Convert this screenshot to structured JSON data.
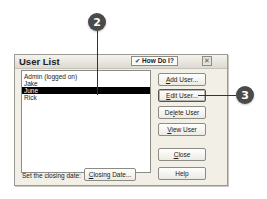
{
  "callouts": [
    {
      "label": "2",
      "target": "June list item"
    },
    {
      "label": "3",
      "target": "Edit User button"
    }
  ],
  "dialog": {
    "title": "User List",
    "how_do_i": {
      "label": "How Do I?",
      "icon": "chevron-down-icon"
    },
    "close_icon": "close-icon",
    "close_glyph": "✕",
    "users": [
      {
        "name": "Admin (logged on)",
        "selected": false
      },
      {
        "name": "Jake",
        "selected": false
      },
      {
        "name": "June",
        "selected": true
      },
      {
        "name": "Rick",
        "selected": false
      }
    ],
    "buttons": {
      "add_user": {
        "mnemonic": "A",
        "rest": "dd User..."
      },
      "edit_user": {
        "mnemonic": "E",
        "rest": "dit User..."
      },
      "delete_user": {
        "pre": "De",
        "mnemonic": "l",
        "rest": "ete User"
      },
      "view_user": {
        "mnemonic": "V",
        "rest": "iew User"
      },
      "close": {
        "mnemonic": "C",
        "rest": "lose"
      },
      "help": {
        "label": "Help"
      }
    },
    "closing_date_label": "Set the closing date:",
    "closing_date_button": {
      "mnemonic": "C",
      "rest": "losing Date..."
    }
  }
}
